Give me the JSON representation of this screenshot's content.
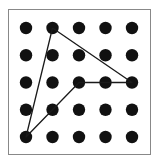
{
  "diagram": {
    "type": "geoboard-dot-grid",
    "grid": {
      "columns": 5,
      "rows": 5
    },
    "frame": {
      "x": 8,
      "y": 9,
      "width": 142,
      "height": 145,
      "stroke": "#888888"
    },
    "dot_x": [
      26,
      52.5,
      79,
      105.5,
      132
    ],
    "dot_y": [
      28,
      55.25,
      82.5,
      109.75,
      137
    ],
    "dot_radius": 6.2,
    "dot_color": "#111111",
    "line_color": "#1a1a1a",
    "polygon": {
      "description": "Quadrilateral-like shape connecting grid points",
      "vertices": [
        [
          1,
          0
        ],
        [
          4,
          2
        ],
        [
          2,
          2
        ],
        [
          1,
          3
        ],
        [
          0,
          4
        ]
      ],
      "closed": true
    }
  }
}
